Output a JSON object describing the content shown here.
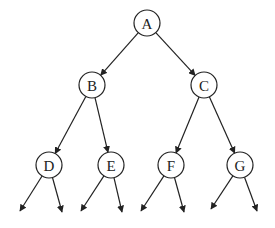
{
  "diagram": {
    "type": "binary-tree",
    "nodes": [
      {
        "id": "A",
        "label": "A",
        "x": 147,
        "y": 23
      },
      {
        "id": "B",
        "label": "B",
        "x": 92,
        "y": 85
      },
      {
        "id": "C",
        "label": "C",
        "x": 204,
        "y": 85
      },
      {
        "id": "D",
        "label": "D",
        "x": 49,
        "y": 165
      },
      {
        "id": "E",
        "label": "E",
        "x": 111,
        "y": 165
      },
      {
        "id": "F",
        "label": "F",
        "x": 171,
        "y": 165
      },
      {
        "id": "G",
        "label": "G",
        "x": 240,
        "y": 165
      }
    ],
    "edges": [
      {
        "from": "A",
        "to": "B"
      },
      {
        "from": "A",
        "to": "C"
      },
      {
        "from": "B",
        "to": "D"
      },
      {
        "from": "B",
        "to": "E"
      },
      {
        "from": "C",
        "to": "F"
      },
      {
        "from": "C",
        "to": "G"
      }
    ],
    "dangling_edges": [
      {
        "from": "D",
        "tip": [
          20,
          211
        ]
      },
      {
        "from": "D",
        "tip": [
          62,
          212
        ]
      },
      {
        "from": "E",
        "tip": [
          81,
          211
        ]
      },
      {
        "from": "E",
        "tip": [
          122,
          212
        ]
      },
      {
        "from": "F",
        "tip": [
          141,
          211
        ]
      },
      {
        "from": "F",
        "tip": [
          184,
          212
        ]
      },
      {
        "from": "G",
        "tip": [
          211,
          209
        ]
      },
      {
        "from": "G",
        "tip": [
          257,
          211
        ]
      }
    ],
    "node_radius": 13
  }
}
